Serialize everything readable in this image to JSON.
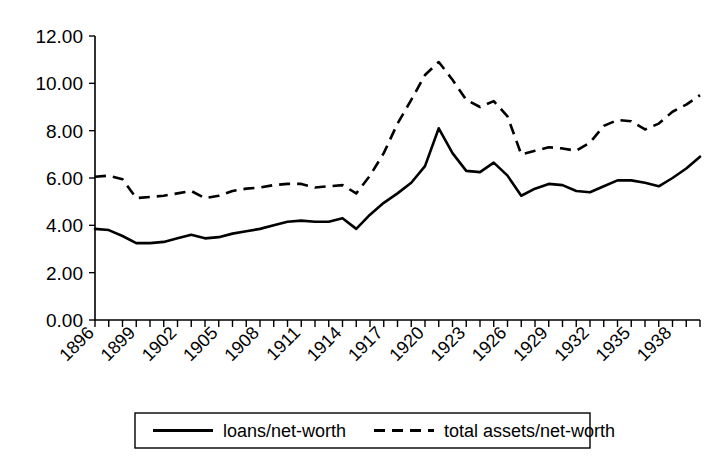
{
  "chart_data": {
    "type": "line",
    "title": "",
    "subtitle": "",
    "xlabel": "",
    "ylabel": "",
    "grid": false,
    "legend_position": "bottom",
    "xlim": [
      1896,
      1940
    ],
    "ylim": [
      0.0,
      12.0
    ],
    "ytick_labels": [
      "12.00",
      "10.00",
      "8.00",
      "6.00",
      "4.00",
      "2.00",
      "0.00"
    ],
    "ytick_values": [
      12.0,
      10.0,
      8.0,
      6.0,
      4.0,
      2.0,
      0.0
    ],
    "xtick_labels": [
      "1896",
      "1899",
      "1902",
      "1905",
      "1908",
      "1911",
      "1914",
      "1917",
      "1920",
      "1923",
      "1926",
      "1929",
      "1932",
      "1935",
      "1938"
    ],
    "xtick_values": [
      1896,
      1899,
      1902,
      1905,
      1908,
      1911,
      1914,
      1917,
      1920,
      1923,
      1926,
      1929,
      1932,
      1935,
      1938
    ],
    "x": [
      1896,
      1897,
      1898,
      1899,
      1900,
      1901,
      1902,
      1903,
      1904,
      1905,
      1906,
      1907,
      1908,
      1909,
      1910,
      1911,
      1912,
      1913,
      1914,
      1915,
      1916,
      1917,
      1918,
      1919,
      1920,
      1921,
      1922,
      1923,
      1924,
      1925,
      1926,
      1927,
      1928,
      1929,
      1930,
      1931,
      1932,
      1933,
      1934,
      1935,
      1936,
      1937,
      1938,
      1939,
      1940
    ],
    "series": [
      {
        "name": "loans/net-worth",
        "style": "solid",
        "color": "#000000",
        "values": [
          3.85,
          3.8,
          3.55,
          3.25,
          3.25,
          3.3,
          3.45,
          3.6,
          3.45,
          3.5,
          3.65,
          3.75,
          3.85,
          4.0,
          4.15,
          4.2,
          4.15,
          4.15,
          4.3,
          3.85,
          4.45,
          4.95,
          5.35,
          5.8,
          6.5,
          8.1,
          7.05,
          6.3,
          6.25,
          6.65,
          6.1,
          5.25,
          5.55,
          5.75,
          5.7,
          5.45,
          5.4,
          5.65,
          5.9,
          5.9,
          5.8,
          5.65,
          6.0,
          6.4,
          6.9
        ]
      },
      {
        "name": "total assets/net-worth",
        "style": "dashed",
        "color": "#000000",
        "values": [
          6.05,
          6.1,
          5.95,
          5.15,
          5.2,
          5.25,
          5.35,
          5.45,
          5.15,
          5.25,
          5.45,
          5.55,
          5.6,
          5.7,
          5.75,
          5.75,
          5.6,
          5.65,
          5.7,
          5.35,
          6.1,
          7.05,
          8.3,
          9.3,
          10.35,
          10.9,
          10.15,
          9.3,
          9.0,
          9.25,
          8.6,
          7.0,
          7.15,
          7.3,
          7.25,
          7.15,
          7.5,
          8.2,
          8.45,
          8.4,
          8.05,
          8.3,
          8.8,
          9.1,
          9.5
        ]
      }
    ]
  },
  "legend": {
    "items": [
      {
        "label": "loans/net-worth",
        "style": "solid"
      },
      {
        "label": "total assets/net-worth",
        "style": "dashed"
      }
    ]
  }
}
